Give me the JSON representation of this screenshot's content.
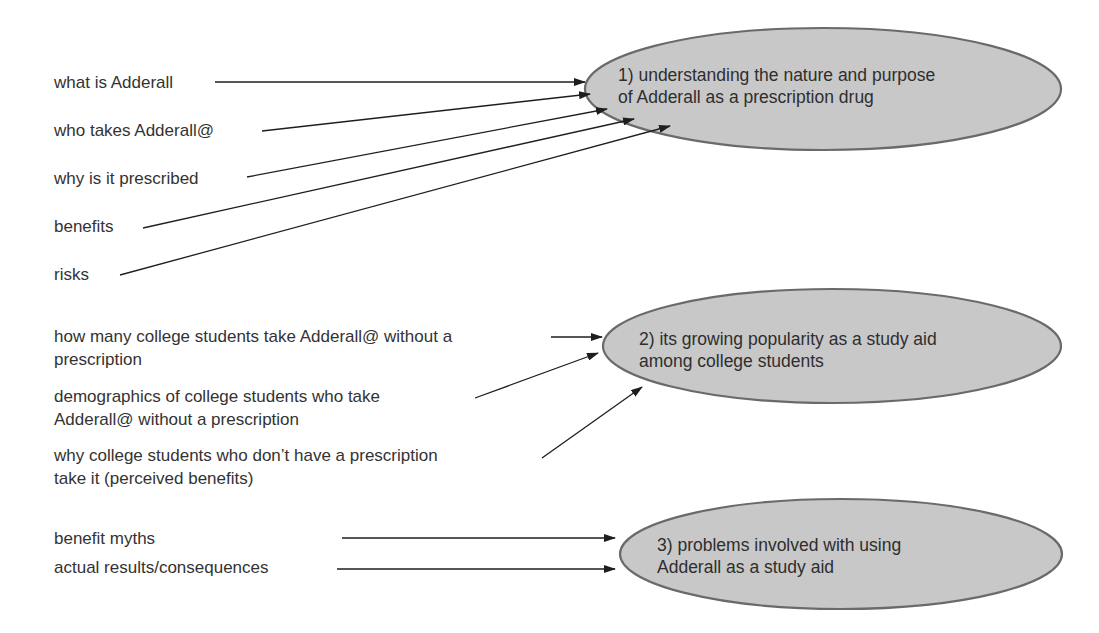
{
  "diagram": {
    "colors": {
      "oval_fill": "#c8c8c8",
      "oval_stroke": "#6a6a6a",
      "arrow": "#1e1e1e",
      "text": "#333333",
      "background": "#ffffff"
    },
    "topics": [
      {
        "id": "topic-1",
        "number": "1)",
        "lines": [
          "1) understanding the nature and purpose",
          "of Adderall as a prescription drug"
        ],
        "subtopics": [
          {
            "lines": [
              "what is Adderall"
            ]
          },
          {
            "lines": [
              "who takes Adderall@"
            ]
          },
          {
            "lines": [
              "why is it prescribed"
            ]
          },
          {
            "lines": [
              "benefits"
            ]
          },
          {
            "lines": [
              "risks"
            ]
          }
        ]
      },
      {
        "id": "topic-2",
        "number": "2)",
        "lines": [
          "2) its growing popularity as a study aid",
          "among college students"
        ],
        "subtopics": [
          {
            "lines": [
              "how many college students take Adderall@ without a",
              "prescription"
            ]
          },
          {
            "lines": [
              "demographics of college students who take",
              "Adderall@ without a prescription"
            ]
          },
          {
            "lines": [
              "why college students who don’t have a prescription",
              "take it (perceived benefits)"
            ]
          }
        ]
      },
      {
        "id": "topic-3",
        "number": "3)",
        "lines": [
          "3) problems involved with using",
          "Adderall as a study aid"
        ],
        "subtopics": [
          {
            "lines": [
              "benefit myths"
            ]
          },
          {
            "lines": [
              "actual results/consequences"
            ]
          }
        ]
      }
    ]
  }
}
